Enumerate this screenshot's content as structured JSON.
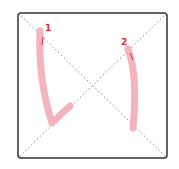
{
  "diagram": {
    "type": "stroke-order",
    "frame": {
      "x": 18,
      "y": 13,
      "width": 149,
      "height": 145,
      "stroke_color": "#333333",
      "corner_radius": 3
    },
    "guides": {
      "style": "dotted",
      "color": "#888888"
    },
    "colors": {
      "stroke": "#f4b4bc",
      "number": "#e0283c",
      "arrow": "#e0283c"
    },
    "strokes": [
      {
        "number": "1",
        "path": "M 40 31 Q 38 80 52 123 Q 60 115 70 106",
        "label_pos": {
          "x": 45,
          "y": 31
        },
        "arrow": {
          "x1": 43,
          "y1": 37,
          "x2": 42,
          "y2": 45
        }
      },
      {
        "number": "2",
        "path": "M 128 49 Q 138 75 133 128",
        "label_pos": {
          "x": 121,
          "y": 45
        },
        "arrow": {
          "x1": 130,
          "y1": 53,
          "x2": 133,
          "y2": 60
        }
      }
    ]
  }
}
